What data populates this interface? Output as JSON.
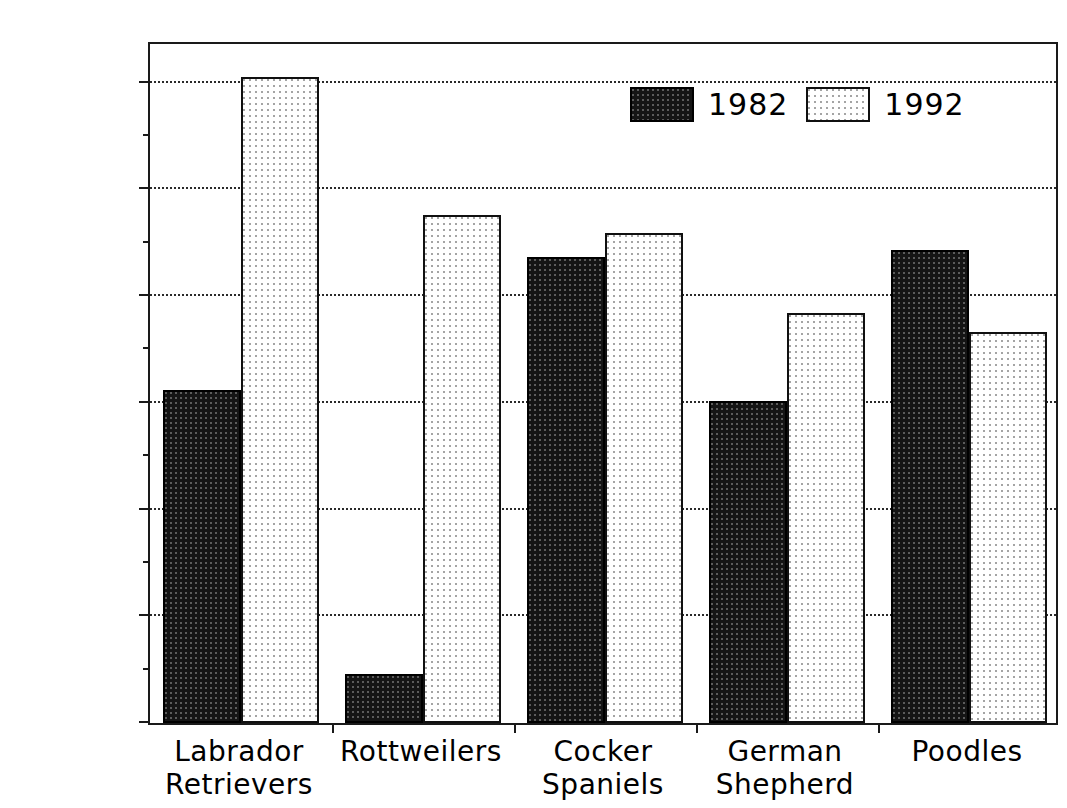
{
  "title": "",
  "legend": {
    "position": "top-right-inside",
    "entries": [
      {
        "label": "1982",
        "swatch": "dark-hatch-swatch"
      },
      {
        "label": "1992",
        "swatch": "light-dot-swatch"
      }
    ]
  },
  "axis": {
    "y_ticks": [
      "0",
      "20,000",
      "40,000",
      "60,000",
      "80,000",
      "100,000",
      "120,000"
    ],
    "y_min": 0,
    "y_max": 128000
  },
  "chart_data": {
    "type": "bar",
    "title": "",
    "xlabel": "",
    "ylabel": "",
    "ylim": [
      0,
      128000
    ],
    "grid": true,
    "legend_position": "top-right-inside",
    "categories": [
      "Labrador Retrievers",
      "Rottweilers",
      "Cocker Spaniels",
      "German Shepherd",
      "Poodles"
    ],
    "category_lines": [
      [
        "Labrador",
        "Retrievers"
      ],
      [
        "Rottweilers",
        ""
      ],
      [
        "Cocker",
        "Spaniels"
      ],
      [
        "German",
        "Shepherd"
      ],
      [
        "Poodles",
        ""
      ]
    ],
    "series": [
      {
        "name": "1982",
        "color": "#151515",
        "values": [
          62500,
          9100,
          87300,
          60300,
          88600
        ]
      },
      {
        "name": "1992",
        "color": "#ffffff",
        "values": [
          121000,
          95300,
          91900,
          76900,
          73300
        ]
      }
    ]
  }
}
